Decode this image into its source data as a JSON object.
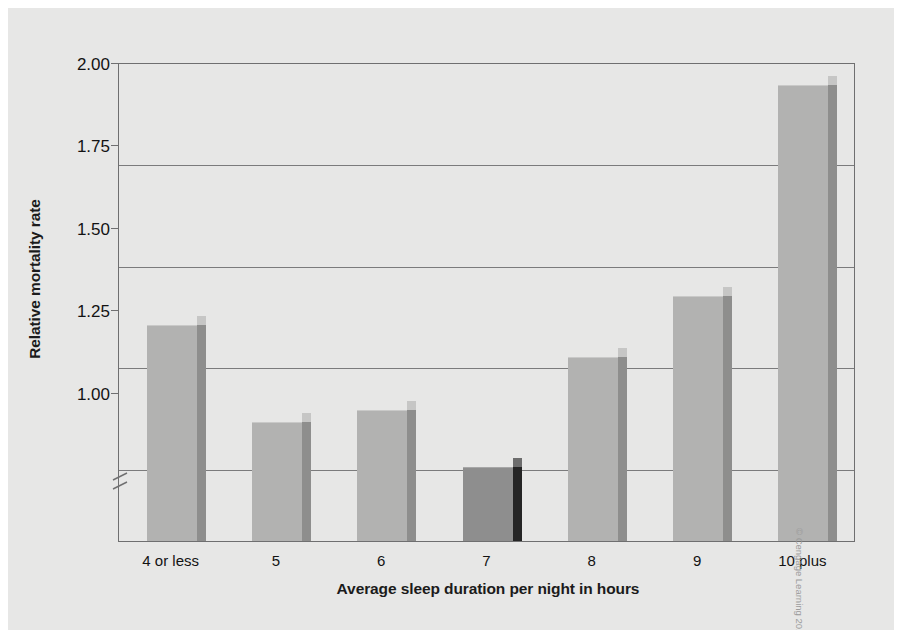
{
  "figure": {
    "credit": "© Cengage Learning 2013",
    "background_color": "#e7e7e6",
    "bar_color": "#b2b2b1",
    "bar_side_color": "#8e8e8d",
    "highlight_bar_color": "#8e8e8e",
    "highlight_bar_side_color": "#252525",
    "axis_color": "#6f6f70"
  },
  "chart_data": {
    "type": "bar",
    "title": "",
    "xlabel": "Average sleep duration per night in hours",
    "ylabel": "Relative mortality rate",
    "categories": [
      "4 or less",
      "5",
      "6",
      "7",
      "8",
      "9",
      "10 plus"
    ],
    "values": [
      1.35,
      1.11,
      1.14,
      1.0,
      1.27,
      1.42,
      1.94
    ],
    "highlight_index": 3,
    "highlight_note": "reference category (7 hours) drawn in dark gray",
    "ylim": [
      0.82,
      2.0
    ],
    "yticks": [
      "1.00",
      "1.25",
      "1.50",
      "1.75",
      "2.00"
    ],
    "ytick_values": [
      1.0,
      1.25,
      1.5,
      1.75,
      2.0
    ],
    "grid": true,
    "axis_break": true,
    "legend": "none"
  }
}
